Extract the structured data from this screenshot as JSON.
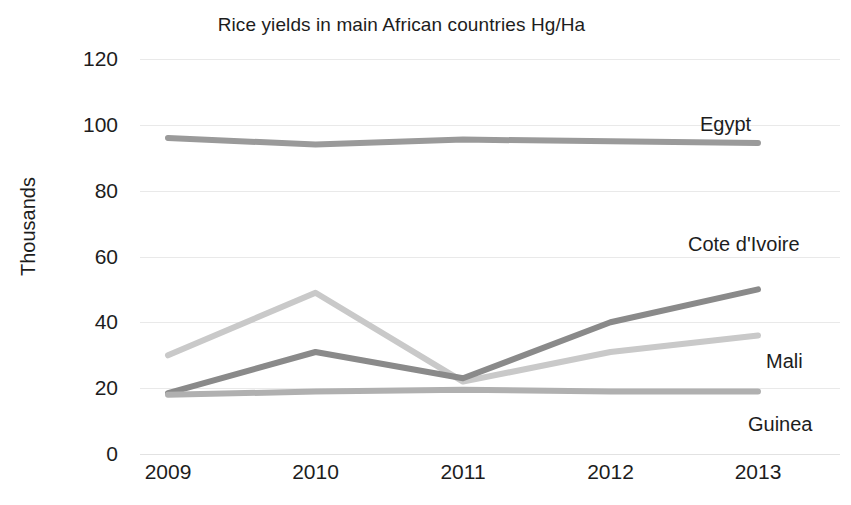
{
  "chart_data": {
    "type": "line",
    "title": "Rice yields in main African countries Hg/Ha",
    "xlabel": "",
    "ylabel": "Thousands",
    "categories": [
      "2009",
      "2010",
      "2011",
      "2012",
      "2013"
    ],
    "x": [
      2009,
      2010,
      2011,
      2012,
      2013
    ],
    "ylim": [
      0,
      120
    ],
    "yticks": [
      0,
      20,
      40,
      60,
      80,
      100,
      120
    ],
    "grid": true,
    "legend_position": "inline-right-labels",
    "series": [
      {
        "name": "Egypt",
        "values": [
          96,
          94,
          95.5,
          95,
          94.5
        ],
        "color": "#9a9a9a"
      },
      {
        "name": "Cote d'Ivoire",
        "values": [
          30,
          49,
          22,
          31,
          36
        ],
        "color": "#c9c9c9"
      },
      {
        "name": "Mali",
        "values": [
          18.5,
          31,
          23,
          40,
          50
        ],
        "color": "#8a8a8a"
      },
      {
        "name": "Guinea",
        "values": [
          18,
          19,
          19.5,
          19,
          19
        ],
        "color": "#b0b0b0"
      }
    ],
    "annotations": [
      {
        "text": "Egypt",
        "x_px": 700,
        "y_px": 113
      },
      {
        "text": "Cote d'Ivoire",
        "x_px": 688,
        "y_px": 233
      },
      {
        "text": "Mali",
        "x_px": 766,
        "y_px": 350
      },
      {
        "text": "Guinea",
        "x_px": 748,
        "y_px": 413
      }
    ]
  },
  "axis": {
    "y_tick_labels": [
      "120",
      "100",
      "80",
      "60",
      "40",
      "20",
      "0"
    ],
    "x_tick_labels": [
      "2009",
      "2010",
      "2011",
      "2012",
      "2013"
    ],
    "y_title": "Thousands"
  },
  "colors": {
    "grid": "#e9e9e9",
    "text": "#1d1d1d",
    "background": "#ffffff"
  }
}
